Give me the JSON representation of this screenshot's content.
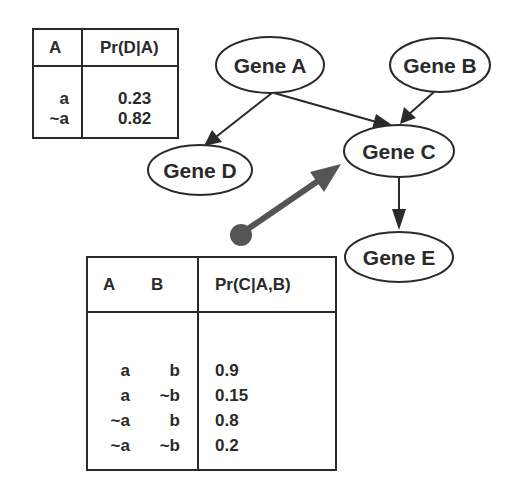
{
  "diagram": {
    "type": "bayesian-network",
    "nodes": [
      {
        "id": "A",
        "label": "Gene A"
      },
      {
        "id": "B",
        "label": "Gene B"
      },
      {
        "id": "C",
        "label": "Gene C"
      },
      {
        "id": "D",
        "label": "Gene D"
      },
      {
        "id": "E",
        "label": "Gene E"
      }
    ],
    "edges": [
      {
        "from": "A",
        "to": "D"
      },
      {
        "from": "A",
        "to": "C"
      },
      {
        "from": "B",
        "to": "C"
      },
      {
        "from": "C",
        "to": "E"
      }
    ],
    "pointer": {
      "from": "cpt_c_table",
      "to": "C"
    },
    "colors": {
      "ink": "#2a2a2a",
      "pointer": "#555555",
      "background": "#ffffff"
    }
  },
  "cpt_d": {
    "headers": [
      "A",
      "Pr(D|A)"
    ],
    "rows": [
      {
        "a": "a",
        "p": "0.23"
      },
      {
        "a": "~a",
        "p": "0.82"
      }
    ]
  },
  "cpt_c": {
    "headers": [
      "A",
      "B",
      "Pr(C|A,B)"
    ],
    "rows": [
      {
        "a": "a",
        "b": "b",
        "p": "0.9"
      },
      {
        "a": "a",
        "b": "~b",
        "p": "0.15"
      },
      {
        "a": "~a",
        "b": "b",
        "p": "0.8"
      },
      {
        "a": "~a",
        "b": "~b",
        "p": "0.2"
      }
    ]
  }
}
